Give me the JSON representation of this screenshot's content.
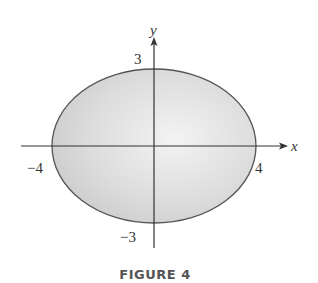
{
  "figure": {
    "caption": "FIGURE 4",
    "axes": {
      "x_label": "x",
      "y_label": "y"
    },
    "ticks": {
      "x_neg": "−4",
      "x_pos": "4",
      "y_pos": "3",
      "y_neg": "−3"
    },
    "ellipse": {
      "semi_major_x": 4,
      "semi_minor_y": 3,
      "fill": "#d6d6d6",
      "stroke": "#555555"
    }
  }
}
